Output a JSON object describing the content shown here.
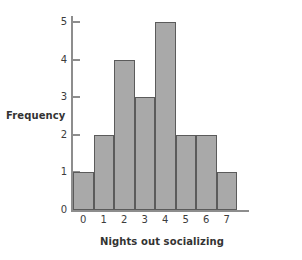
{
  "chart_data": {
    "type": "bar",
    "title": "",
    "subtitle": "",
    "xlabel": "Nights out socializing",
    "ylabel": "Frequency",
    "categories": [
      "0",
      "1",
      "2",
      "3",
      "4",
      "5",
      "6",
      "7"
    ],
    "values": [
      1,
      2,
      4,
      3,
      5,
      2,
      2,
      1
    ],
    "series": [
      {
        "name": "Frequency",
        "values": [
          1,
          2,
          4,
          3,
          5,
          2,
          2,
          1
        ]
      }
    ],
    "xlim": [
      0,
      8
    ],
    "ylim": [
      0,
      5
    ],
    "ytick_labels": [
      "0",
      "1",
      "2",
      "3",
      "4",
      "5"
    ],
    "ytick_values": [
      0,
      1,
      2,
      3,
      4,
      5
    ],
    "xtick_labels": [
      "0",
      "1",
      "2",
      "3",
      "4",
      "5",
      "6",
      "7"
    ],
    "grid": false,
    "legend": false,
    "legend_position": "none",
    "annotations": [],
    "colors": {
      "bar_fill": "#a9a9a9",
      "bar_edge": "#5b5b5b",
      "axis": "#8d8d8d",
      "text": "#333333",
      "background": "#ffffff"
    }
  }
}
